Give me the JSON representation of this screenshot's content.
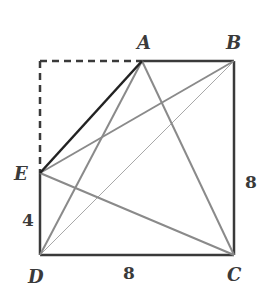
{
  "figure": {
    "points": {
      "A": {
        "label": "A",
        "x": 142,
        "y": 61
      },
      "B": {
        "label": "B",
        "x": 234,
        "y": 61
      },
      "C": {
        "label": "C",
        "x": 234,
        "y": 255
      },
      "D": {
        "label": "D",
        "x": 40,
        "y": 255
      },
      "E": {
        "label": "E",
        "x": 40,
        "y": 173
      },
      "Corner": {
        "x": 40,
        "y": 61
      }
    },
    "measurements": {
      "bottom": "8",
      "right": "8",
      "left_lower": "4"
    },
    "segments": [
      {
        "from": "A",
        "to": "B",
        "style": "solid-dark"
      },
      {
        "from": "B",
        "to": "C",
        "style": "solid-dark"
      },
      {
        "from": "C",
        "to": "D",
        "style": "solid-dark"
      },
      {
        "from": "D",
        "to": "E",
        "style": "solid-dark"
      },
      {
        "from": "Corner",
        "to": "A",
        "style": "dashed"
      },
      {
        "from": "Corner",
        "to": "E",
        "style": "dashed"
      },
      {
        "from": "A",
        "to": "E",
        "style": "solid-black"
      },
      {
        "from": "A",
        "to": "D",
        "style": "gray"
      },
      {
        "from": "A",
        "to": "C",
        "style": "gray"
      },
      {
        "from": "E",
        "to": "B",
        "style": "gray"
      },
      {
        "from": "E",
        "to": "C",
        "style": "gray"
      },
      {
        "from": "B",
        "to": "D",
        "style": "light-gray-thin"
      }
    ],
    "colors": {
      "dark": "#3a3a3a",
      "black": "#222222",
      "gray": "#8a8a8a",
      "light": "#a8a8a8"
    }
  }
}
